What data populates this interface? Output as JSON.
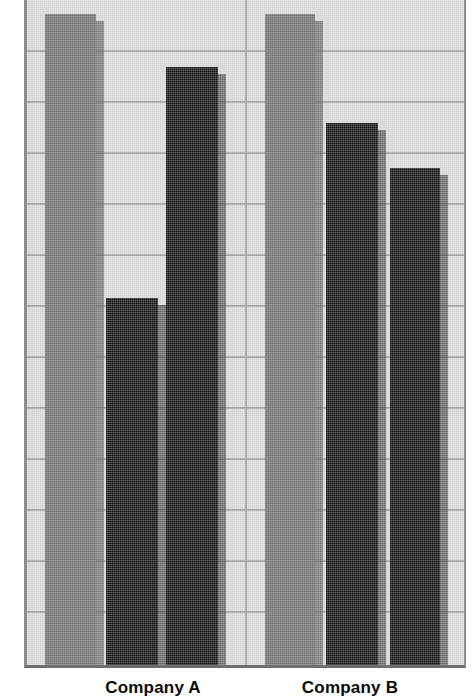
{
  "chart_data": {
    "type": "bar",
    "title": "",
    "subtitle": "",
    "xlabel": "",
    "ylabel": "",
    "categories": [
      "Company A",
      "Company B"
    ],
    "series": [
      {
        "name": "Series 1",
        "color": "#6e6e6e",
        "values": [
          98,
          98
        ]
      },
      {
        "name": "Series 2",
        "color": "#0d0d0d",
        "values": [
          55,
          81
        ]
      },
      {
        "name": "Series 3",
        "color": "#0d0d0d",
        "values": [
          90,
          74
        ]
      }
    ],
    "ylim": [
      0,
      100
    ],
    "grid": true,
    "gridlines_y": [
      92,
      84,
      77,
      69,
      61,
      54,
      46,
      38,
      31,
      23,
      15,
      8
    ],
    "legend_position": "none"
  },
  "axis": {
    "baseline_visible": true,
    "tick_labels_y": [],
    "tick_labels_x": [
      "Company A",
      "Company B"
    ]
  },
  "colors": {
    "plot_background": "#d8d8d6",
    "gridline": "#9a9a98",
    "frame": "#8d8d8d",
    "baseline": "#6f6f6f",
    "bar_gray": "#6e6e6e",
    "bar_black": "#0d0d0d",
    "label_text": "#0a0a0a"
  },
  "bars": [
    {
      "name": "company-a-series-1",
      "group": "Company A",
      "series": "Series 1",
      "fill": "gray",
      "left": 18,
      "width": 51,
      "top": 17,
      "value": 98
    },
    {
      "name": "company-a-series-2",
      "group": "Company A",
      "series": "Series 2",
      "fill": "black",
      "left": 79,
      "width": 52,
      "top": 301,
      "value": 55
    },
    {
      "name": "company-a-series-3",
      "group": "Company A",
      "series": "Series 3",
      "fill": "black",
      "left": 139,
      "width": 52,
      "top": 70,
      "value": 90
    },
    {
      "name": "company-b-series-1",
      "group": "Company B",
      "series": "Series 1",
      "fill": "gray",
      "left": 238,
      "width": 50,
      "top": 17,
      "value": 98
    },
    {
      "name": "company-b-series-2",
      "group": "Company B",
      "series": "Series 2",
      "fill": "black",
      "left": 299,
      "width": 52,
      "top": 126,
      "value": 81
    },
    {
      "name": "company-b-series-3",
      "group": "Company B",
      "series": "Series 3",
      "fill": "black",
      "left": 363,
      "width": 50,
      "top": 171,
      "value": 74
    }
  ],
  "gridlines": {
    "horizontal_y": [
      54,
      105,
      156,
      207,
      258,
      309,
      360,
      411,
      462,
      513,
      564,
      615
    ],
    "vertical_x": [
      218
    ]
  },
  "labels": [
    {
      "name": "category-label-company-a",
      "text": "Company A",
      "center_x": 153
    },
    {
      "name": "category-label-company-b",
      "text": "Company B",
      "center_x": 350
    }
  ]
}
